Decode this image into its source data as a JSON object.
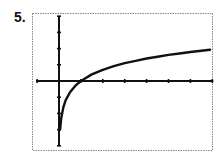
{
  "problem": {
    "label": "5."
  },
  "colors": {
    "curve": "#111111",
    "axes": "#111111",
    "frame": "#888888",
    "background": "#ffffff"
  },
  "chart_data": {
    "type": "line",
    "title": "",
    "xlabel": "",
    "ylabel": "",
    "function_estimate": "y = ln(x)",
    "xlim": [
      -1,
      7
    ],
    "ylim": [
      -4,
      4
    ],
    "xscale_ticks": 1,
    "yscale_ticks": 1,
    "grid": false,
    "frame": "dotted",
    "series": [
      {
        "name": "f(x)",
        "x": [
          0.05,
          0.1,
          0.2,
          0.3,
          0.5,
          0.75,
          1,
          1.5,
          2,
          2.5,
          3,
          3.5,
          4,
          4.5,
          5,
          5.5,
          6,
          6.5,
          6.9
        ],
        "y": [
          -3.0,
          -2.3,
          -1.61,
          -1.2,
          -0.69,
          -0.29,
          0,
          0.41,
          0.69,
          0.92,
          1.1,
          1.25,
          1.39,
          1.5,
          1.61,
          1.7,
          1.79,
          1.87,
          1.93
        ]
      }
    ]
  }
}
